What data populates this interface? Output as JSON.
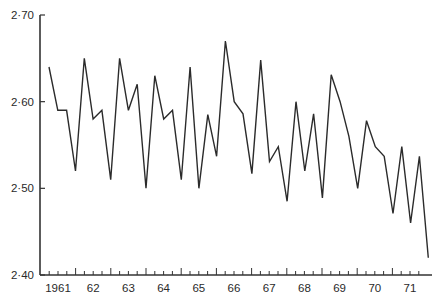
{
  "chart_data": {
    "type": "line",
    "title": "",
    "xlabel": "",
    "ylabel": "",
    "ylim": [
      2.4,
      2.7
    ],
    "yticks": [
      2.4,
      2.5,
      2.6,
      2.7
    ],
    "ytick_labels": [
      "2·40",
      "2·50",
      "2·60",
      "2·70"
    ],
    "xlim": [
      1960.75,
      1971.25
    ],
    "xtick_labels": [
      {
        "year": 1961,
        "label": "1961"
      },
      {
        "year": 1962,
        "label": "62"
      },
      {
        "year": 1963,
        "label": "63"
      },
      {
        "year": 1964,
        "label": "64"
      },
      {
        "year": 1965,
        "label": "65"
      },
      {
        "year": 1966,
        "label": "66"
      },
      {
        "year": 1967,
        "label": "67"
      },
      {
        "year": 1968,
        "label": "68"
      },
      {
        "year": 1969,
        "label": "69"
      },
      {
        "year": 1970,
        "label": "70"
      },
      {
        "year": 1971,
        "label": "71"
      }
    ],
    "grid": false,
    "legend": "none",
    "series": [
      {
        "name": "quarterly series",
        "values": [
          2.64,
          2.59,
          2.59,
          2.52,
          2.65,
          2.58,
          2.59,
          2.51,
          2.65,
          2.59,
          2.62,
          2.5,
          2.63,
          2.58,
          2.59,
          2.51,
          2.64,
          2.5,
          2.585,
          2.537,
          2.67,
          2.6,
          2.586,
          2.517,
          2.648,
          2.531,
          2.548,
          2.485,
          2.6,
          2.52,
          2.586,
          2.489,
          2.631,
          2.6,
          2.56,
          2.5,
          2.578,
          2.548,
          2.537,
          2.471,
          2.548,
          2.46,
          2.537,
          2.42
        ]
      }
    ]
  }
}
